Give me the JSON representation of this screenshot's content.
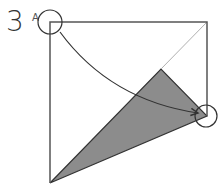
{
  "diagram": {
    "step_number": "3",
    "point_label": "A",
    "colors": {
      "outline": "#555555",
      "fill": "#8c8c8c",
      "diagonal": "#b0b0b0",
      "arrow": "#333333"
    },
    "square": {
      "x1": 50,
      "y1": 22,
      "x2": 207,
      "y2": 183
    },
    "shaded_triangle": [
      [
        50,
        183
      ],
      [
        161,
        69
      ],
      [
        207,
        116
      ]
    ],
    "circles": [
      {
        "name": "corner-a",
        "cx": 50,
        "cy": 22,
        "r": 12
      },
      {
        "name": "target",
        "cx": 206,
        "cy": 116,
        "r": 11
      }
    ]
  }
}
